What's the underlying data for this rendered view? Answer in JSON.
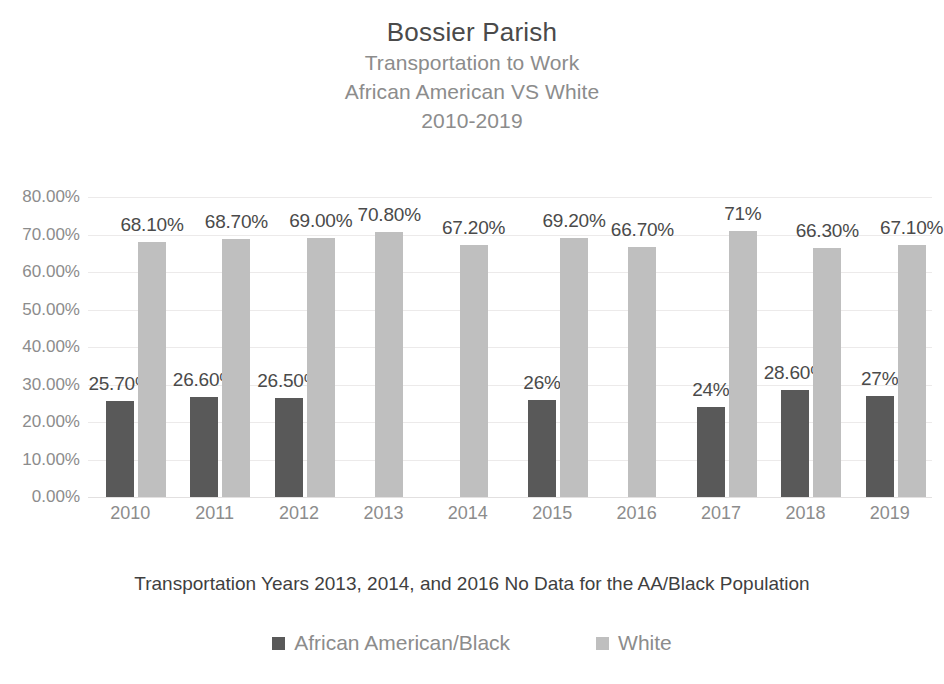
{
  "chart_data": {
    "type": "bar",
    "title": "Bossier Parish",
    "subtitles": [
      "Transportation to Work",
      "African American VS White",
      "2010-2019"
    ],
    "categories": [
      "2010",
      "2011",
      "2012",
      "2013",
      "2014",
      "2015",
      "2016",
      "2017",
      "2018",
      "2019"
    ],
    "series": [
      {
        "name": "African American/Black",
        "color": "#595959",
        "values": [
          25.7,
          26.6,
          26.5,
          null,
          null,
          26,
          null,
          24,
          28.6,
          27
        ],
        "labels": [
          "25.70%",
          "26.60%",
          "26.50%",
          "",
          "",
          "26%",
          "",
          "24%",
          "28.60%",
          "27%"
        ]
      },
      {
        "name": "White",
        "color": "#bfbfbf",
        "values": [
          68.1,
          68.7,
          69.0,
          70.8,
          67.2,
          69.2,
          66.7,
          71,
          66.3,
          67.1
        ],
        "labels": [
          "68.10%",
          "68.70%",
          "69.00%",
          "70.80%",
          "67.20%",
          "69.20%",
          "66.70%",
          "71%",
          "66.30%",
          "67.10%"
        ]
      }
    ],
    "ylabel": "",
    "xlabel": "",
    "ylim": [
      0,
      80
    ],
    "ytick_labels": [
      "80.00%",
      "70.00%",
      "60.00%",
      "50.00%",
      "40.00%",
      "30.00%",
      "20.00%",
      "10.00%",
      "0.00%"
    ],
    "ytick_values": [
      80,
      70,
      60,
      50,
      40,
      30,
      20,
      10,
      0
    ],
    "grid": true,
    "legend_position": "bottom",
    "annotation": "Transportation Years  2013, 2014, and 2016 No Data for the AA/Black Population"
  },
  "legend": {
    "items": [
      {
        "label": "African American/Black",
        "color": "#595959"
      },
      {
        "label": "White",
        "color": "#bfbfbf"
      }
    ]
  }
}
